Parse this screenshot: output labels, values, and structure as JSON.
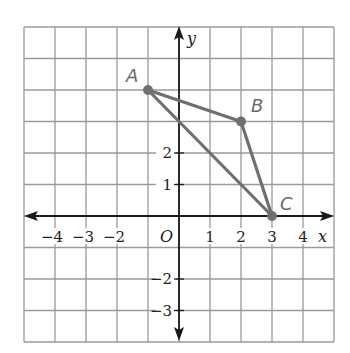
{
  "diagram": {
    "type": "coordinate-plane",
    "grid": {
      "x_min": -5,
      "x_max": 5,
      "y_min": -4,
      "y_max": 6,
      "step": 1
    },
    "axes": {
      "x_label": "x",
      "y_label": "y",
      "origin_label": "O"
    },
    "x_ticks": [
      {
        "value": -4,
        "label": "−4"
      },
      {
        "value": -3,
        "label": "−3"
      },
      {
        "value": -2,
        "label": "−2"
      },
      {
        "value": 1,
        "label": "1"
      },
      {
        "value": 2,
        "label": "2"
      },
      {
        "value": 3,
        "label": "3"
      },
      {
        "value": 4,
        "label": "4"
      }
    ],
    "y_ticks": [
      {
        "value": 2,
        "label": "2"
      },
      {
        "value": 1,
        "label": "1"
      },
      {
        "value": -2,
        "label": "−2"
      },
      {
        "value": -3,
        "label": "−3"
      }
    ],
    "points": [
      {
        "name": "A",
        "x": -1,
        "y": 4
      },
      {
        "name": "B",
        "x": 2,
        "y": 3
      },
      {
        "name": "C",
        "x": 3,
        "y": 0
      }
    ],
    "segments": [
      [
        "A",
        "B"
      ],
      [
        "B",
        "C"
      ],
      [
        "A",
        "C"
      ]
    ],
    "colors": {
      "grid": "#9a9a9a",
      "axis": "#1a1a1a",
      "triangle": "#6f6f6f"
    }
  }
}
